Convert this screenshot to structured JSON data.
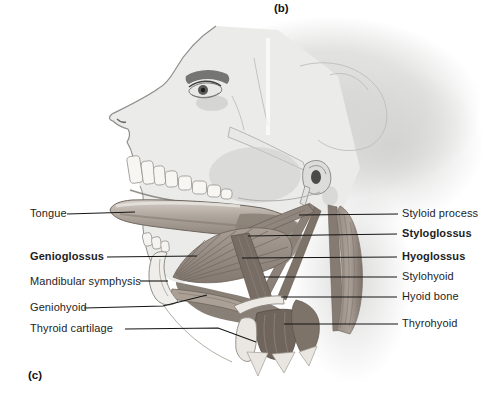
{
  "figure": {
    "panel_label_top": "(b)",
    "panel_label_bottom": "(c)"
  },
  "labels": {
    "left": [
      {
        "text": "Tongue",
        "bold": false
      },
      {
        "text": "Genioglossus",
        "bold": true
      },
      {
        "text": "Mandibular symphysis",
        "bold": false
      },
      {
        "text": "Geniohyoid",
        "bold": false
      },
      {
        "text": "Thyroid cartilage",
        "bold": false
      }
    ],
    "right": [
      {
        "text": "Styloid process",
        "bold": false
      },
      {
        "text": "Styloglossus",
        "bold": true
      },
      {
        "text": "Hyoglossus",
        "bold": true
      },
      {
        "text": "Stylohyoid",
        "bold": false
      },
      {
        "text": "Hyoid bone",
        "bold": false
      },
      {
        "text": "Thyrohyoid",
        "bold": false
      }
    ]
  },
  "colors": {
    "leader_line": "#151515",
    "label_text": "#1d1d1d",
    "bone_light": "#efecea",
    "muscle_mid": "#968c83",
    "muscle_dark": "#6f655c",
    "background": "#ffffff"
  }
}
